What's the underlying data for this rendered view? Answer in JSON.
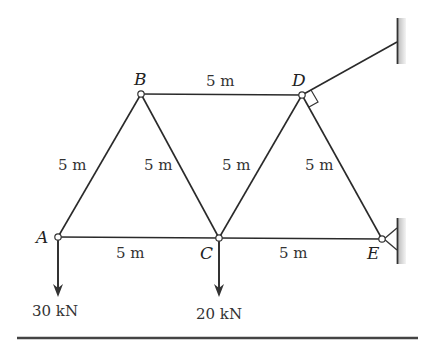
{
  "diagram": {
    "type": "truss",
    "nodes": {
      "A": {
        "label": "A",
        "x": 58,
        "y": 237
      },
      "B": {
        "label": "B",
        "x": 141,
        "y": 94
      },
      "C": {
        "label": "C",
        "x": 219,
        "y": 238
      },
      "D": {
        "label": "D",
        "x": 302,
        "y": 95
      },
      "E": {
        "label": "E",
        "x": 382,
        "y": 239
      }
    },
    "members": [
      {
        "from": "A",
        "to": "B",
        "length_label": "5 m"
      },
      {
        "from": "B",
        "to": "C",
        "length_label": "5 m"
      },
      {
        "from": "B",
        "to": "D",
        "length_label": "5 m"
      },
      {
        "from": "C",
        "to": "D",
        "length_label": "5 m"
      },
      {
        "from": "D",
        "to": "E",
        "length_label": "5 m"
      },
      {
        "from": "A",
        "to": "C",
        "length_label": "5 m"
      },
      {
        "from": "C",
        "to": "E",
        "length_label": "5 m"
      }
    ],
    "labels": {
      "node_a": "A",
      "node_b": "B",
      "node_c": "C",
      "node_d": "D",
      "node_e": "E",
      "len_ab": "5 m",
      "len_bc": "5 m",
      "len_bd": "5 m",
      "len_cd": "5 m",
      "len_de": "5 m",
      "len_ac": "5 m",
      "len_ce": "5 m"
    },
    "loads": [
      {
        "node": "A",
        "label": "30 kN",
        "direction": "down"
      },
      {
        "node": "C",
        "label": "20 kN",
        "direction": "down"
      }
    ],
    "load_labels": {
      "load_a": "30 kN",
      "load_c": "20 kN"
    },
    "supports": [
      {
        "node": "D",
        "type": "cable-to-wall",
        "note": "cable perpendicular to member DE"
      },
      {
        "node": "E",
        "type": "pin-to-wall"
      }
    ]
  }
}
